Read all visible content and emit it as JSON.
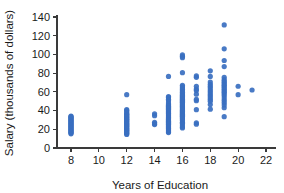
{
  "chart_data": {
    "type": "scatter",
    "title": "",
    "xlabel": "Years of Education",
    "ylabel": "Salary (thousands of dollars)",
    "xlim": [
      7,
      22.6
    ],
    "ylim": [
      0,
      145
    ],
    "xticks": [
      8,
      10,
      12,
      14,
      16,
      18,
      20,
      22
    ],
    "yticks": [
      0,
      20,
      40,
      60,
      80,
      100,
      120,
      140
    ],
    "grid": false,
    "legend": null,
    "marker": {
      "color": "#3a6fc0",
      "shape": "circle",
      "size": 2.6
    },
    "series": [
      {
        "name": "Salary vs Years of Education",
        "points": [
          [
            8,
            15.2
          ],
          [
            8,
            16.0
          ],
          [
            8,
            16.8
          ],
          [
            8,
            17.6
          ],
          [
            8,
            18.4
          ],
          [
            8,
            19.2
          ],
          [
            8,
            20.0
          ],
          [
            8,
            20.8
          ],
          [
            8,
            21.6
          ],
          [
            8,
            22.4
          ],
          [
            8,
            23.2
          ],
          [
            8,
            24.0
          ],
          [
            8,
            24.8
          ],
          [
            8,
            25.6
          ],
          [
            8,
            26.4
          ],
          [
            8,
            27.2
          ],
          [
            8,
            28.0
          ],
          [
            8,
            28.8
          ],
          [
            8,
            29.6
          ],
          [
            8,
            30.4
          ],
          [
            8,
            31.2
          ],
          [
            8,
            32.0
          ],
          [
            8,
            32.8
          ],
          [
            8,
            33.6
          ],
          [
            8,
            34.2
          ],
          [
            12,
            14.5
          ],
          [
            12,
            15.4
          ],
          [
            12,
            16.3
          ],
          [
            12,
            17.2
          ],
          [
            12,
            18.1
          ],
          [
            12,
            19.0
          ],
          [
            12,
            19.9
          ],
          [
            12,
            20.8
          ],
          [
            12,
            21.7
          ],
          [
            12,
            22.6
          ],
          [
            12,
            23.5
          ],
          [
            12,
            24.4
          ],
          [
            12,
            25.3
          ],
          [
            12,
            26.2
          ],
          [
            12,
            27.1
          ],
          [
            12,
            28.0
          ],
          [
            12,
            28.9
          ],
          [
            12,
            29.8
          ],
          [
            12,
            30.7
          ],
          [
            12,
            31.6
          ],
          [
            12,
            32.5
          ],
          [
            12,
            33.4
          ],
          [
            12,
            34.3
          ],
          [
            12,
            35.2
          ],
          [
            12,
            36.1
          ],
          [
            12,
            37.0
          ],
          [
            12,
            38.5
          ],
          [
            12,
            40.0
          ],
          [
            12,
            41.0
          ],
          [
            12,
            57.0
          ],
          [
            14,
            25.0
          ],
          [
            14,
            26.0
          ],
          [
            14,
            27.5
          ],
          [
            14,
            34.5
          ],
          [
            14,
            36.5
          ],
          [
            15,
            16.5
          ],
          [
            15,
            17.5
          ],
          [
            15,
            18.5
          ],
          [
            15,
            19.5
          ],
          [
            15,
            20.5
          ],
          [
            15,
            21.5
          ],
          [
            15,
            22.5
          ],
          [
            15,
            23.5
          ],
          [
            15,
            24.5
          ],
          [
            15,
            25.5
          ],
          [
            15,
            26.5
          ],
          [
            15,
            27.5
          ],
          [
            15,
            28.5
          ],
          [
            15,
            29.5
          ],
          [
            15,
            30.5
          ],
          [
            15,
            31.5
          ],
          [
            15,
            32.5
          ],
          [
            15,
            33.5
          ],
          [
            15,
            34.5
          ],
          [
            15,
            35.5
          ],
          [
            15,
            36.5
          ],
          [
            15,
            37.5
          ],
          [
            15,
            38.5
          ],
          [
            15,
            39.5
          ],
          [
            15,
            40.5
          ],
          [
            15,
            41.5
          ],
          [
            15,
            42.5
          ],
          [
            15,
            43.5
          ],
          [
            15,
            44.5
          ],
          [
            15,
            45.5
          ],
          [
            15,
            46.5
          ],
          [
            15,
            48.0
          ],
          [
            15,
            50.5
          ],
          [
            15,
            52.0
          ],
          [
            15,
            54.0
          ],
          [
            15,
            55.0
          ],
          [
            15,
            76.5
          ],
          [
            16,
            21.5
          ],
          [
            16,
            22.5
          ],
          [
            16,
            24.5
          ],
          [
            16,
            26.5
          ],
          [
            16,
            27.5
          ],
          [
            16,
            29.5
          ],
          [
            16,
            31.0
          ],
          [
            16,
            32.0
          ],
          [
            16,
            33.0
          ],
          [
            16,
            34.0
          ],
          [
            16,
            35.0
          ],
          [
            16,
            36.0
          ],
          [
            16,
            37.0
          ],
          [
            16,
            38.0
          ],
          [
            16,
            39.0
          ],
          [
            16,
            40.0
          ],
          [
            16,
            41.0
          ],
          [
            16,
            42.0
          ],
          [
            16,
            43.0
          ],
          [
            16,
            44.0
          ],
          [
            16,
            45.0
          ],
          [
            16,
            46.0
          ],
          [
            16,
            47.0
          ],
          [
            16,
            48.0
          ],
          [
            16,
            49.0
          ],
          [
            16,
            50.0
          ],
          [
            16,
            51.0
          ],
          [
            16,
            52.0
          ],
          [
            16,
            53.0
          ],
          [
            16,
            54.0
          ],
          [
            16,
            55.0
          ],
          [
            16,
            56.0
          ],
          [
            16,
            57.0
          ],
          [
            16,
            58.0
          ],
          [
            16,
            59.5
          ],
          [
            16,
            61.0
          ],
          [
            16,
            62.5
          ],
          [
            16,
            64.0
          ],
          [
            16,
            65.5
          ],
          [
            16,
            67.0
          ],
          [
            16,
            80.5
          ],
          [
            16,
            96.5
          ],
          [
            16,
            98.0
          ],
          [
            16,
            99.5
          ],
          [
            17,
            25.5
          ],
          [
            17,
            27.0
          ],
          [
            17,
            41.0
          ],
          [
            17,
            50.5
          ],
          [
            17,
            52.0
          ],
          [
            17,
            57.5
          ],
          [
            17,
            61.5
          ],
          [
            17,
            63.0
          ],
          [
            17,
            66.0
          ],
          [
            17,
            75.5
          ],
          [
            17,
            77.0
          ],
          [
            18,
            41.5
          ],
          [
            18,
            46.5
          ],
          [
            18,
            50.0
          ],
          [
            18,
            52.0
          ],
          [
            18,
            54.0
          ],
          [
            18,
            56.0
          ],
          [
            18,
            58.0
          ],
          [
            18,
            60.0
          ],
          [
            18,
            62.0
          ],
          [
            18,
            64.0
          ],
          [
            18,
            66.0
          ],
          [
            18,
            68.0
          ],
          [
            18,
            70.5
          ],
          [
            18,
            76.5
          ],
          [
            18,
            82.5
          ],
          [
            19,
            33.5
          ],
          [
            19,
            43.0
          ],
          [
            19,
            46.0
          ],
          [
            19,
            48.5
          ],
          [
            19,
            51.0
          ],
          [
            19,
            53.5
          ],
          [
            19,
            56.0
          ],
          [
            19,
            58.0
          ],
          [
            19,
            59.5
          ],
          [
            19,
            61.0
          ],
          [
            19,
            62.5
          ],
          [
            19,
            64.0
          ],
          [
            19,
            65.5
          ],
          [
            19,
            67.0
          ],
          [
            19,
            68.5
          ],
          [
            19,
            70.0
          ],
          [
            19,
            71.5
          ],
          [
            19,
            73.0
          ],
          [
            19,
            75.5
          ],
          [
            19,
            87.0
          ],
          [
            19,
            93.5
          ],
          [
            19,
            106.0
          ],
          [
            19,
            131.5
          ],
          [
            20,
            57.0
          ],
          [
            20,
            66.0
          ],
          [
            21,
            62.0
          ]
        ]
      }
    ]
  }
}
